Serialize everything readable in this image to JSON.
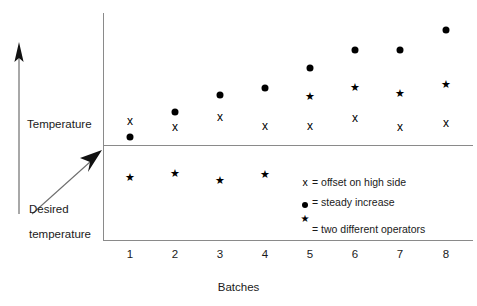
{
  "chart_data": {
    "type": "scatter",
    "title": "",
    "xlabel": "Batches",
    "ylabel": "Temperature",
    "categories": [
      "1",
      "2",
      "3",
      "4",
      "5",
      "6",
      "7",
      "8"
    ],
    "grid": false,
    "legend_position": "inside-lower-right",
    "reference_lines": [
      {
        "name": "Temperature",
        "y_label": "Temperature"
      },
      {
        "name": "Desired temperature",
        "y_label": "Desired temperature"
      }
    ],
    "series": [
      {
        "name": "offset on high side",
        "symbol": "x",
        "x": [
          1,
          2,
          3,
          4,
          5,
          6,
          7,
          8
        ],
        "y": [
          121,
          127,
          117,
          126,
          126,
          118,
          127,
          123
        ]
      },
      {
        "name": "steady increase",
        "symbol": "dot",
        "x": [
          1,
          2,
          3,
          4,
          5,
          6,
          7,
          8
        ],
        "y": [
          137,
          112,
          95,
          88,
          68,
          50,
          50,
          30
        ]
      },
      {
        "name": "two different operators",
        "symbol": "star",
        "x": [
          1,
          2,
          3,
          4,
          5,
          6,
          7,
          8
        ],
        "y": [
          177,
          173,
          180,
          174,
          96,
          87,
          93,
          84
        ]
      }
    ]
  },
  "axis": {
    "y_top_label": "Temperature",
    "y_bottom_label_line1": "Desired",
    "y_bottom_label_line2": "temperature",
    "x_title": "Batches",
    "x_ticks": [
      "1",
      "2",
      "3",
      "4",
      "5",
      "6",
      "7",
      "8"
    ]
  },
  "legend": {
    "items": [
      {
        "symbol": "x",
        "text": "= offset on high side"
      },
      {
        "symbol": "dot",
        "text": "= steady increase"
      },
      {
        "symbol": "star",
        "text": "= two different operators"
      }
    ]
  },
  "markers": {
    "x_series": [
      {
        "x": 130,
        "y": 121
      },
      {
        "x": 175,
        "y": 127
      },
      {
        "x": 220,
        "y": 117
      },
      {
        "x": 265,
        "y": 126
      },
      {
        "x": 310,
        "y": 126
      },
      {
        "x": 355,
        "y": 118
      },
      {
        "x": 400,
        "y": 127
      },
      {
        "x": 446,
        "y": 123
      }
    ],
    "dot_series": [
      {
        "x": 130,
        "y": 137
      },
      {
        "x": 175,
        "y": 112
      },
      {
        "x": 220,
        "y": 95
      },
      {
        "x": 265,
        "y": 88
      },
      {
        "x": 310,
        "y": 68
      },
      {
        "x": 355,
        "y": 50
      },
      {
        "x": 400,
        "y": 50
      },
      {
        "x": 446,
        "y": 30
      }
    ],
    "star_series": [
      {
        "x": 130,
        "y": 177
      },
      {
        "x": 175,
        "y": 173
      },
      {
        "x": 220,
        "y": 180
      },
      {
        "x": 265,
        "y": 174
      },
      {
        "x": 310,
        "y": 96
      },
      {
        "x": 355,
        "y": 87
      },
      {
        "x": 400,
        "y": 93
      },
      {
        "x": 446,
        "y": 84
      }
    ],
    "tick_positions": [
      130,
      175,
      220,
      265,
      310,
      355,
      400,
      446
    ],
    "glyphs": {
      "x": "x",
      "star": "★"
    }
  },
  "colors": {
    "marker": "#000000",
    "axis": "#8a8a8a",
    "text": "#1a1a1a",
    "background": "#ffffff"
  }
}
